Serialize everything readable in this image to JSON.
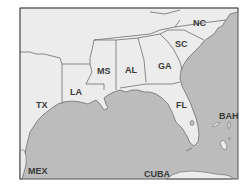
{
  "map": {
    "colors": {
      "land": "#ececec",
      "water": "#bcbcbc",
      "border": "#6e6e6e",
      "frame": "#555555",
      "label": "#3a3a3a"
    },
    "labels": {
      "nc": "NC",
      "sc": "SC",
      "ga": "GA",
      "al": "AL",
      "ms": "MS",
      "la": "LA",
      "tx": "TX",
      "fl": "FL",
      "bah": "BAH",
      "cuba": "CUBA",
      "mex": "MEX"
    }
  }
}
